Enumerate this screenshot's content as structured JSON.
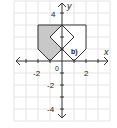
{
  "diagram": {
    "type": "coordinate-grid",
    "axes": {
      "x_label": "x",
      "y_label": "y",
      "origin_label": "0",
      "x_ticks": [
        {
          "value": -2,
          "label": "-2"
        },
        {
          "value": 2,
          "label": "2"
        }
      ],
      "y_ticks": [
        {
          "value": 4,
          "label": "4"
        },
        {
          "value": -2,
          "label": "-2"
        },
        {
          "value": -4,
          "label": "-4"
        }
      ],
      "x_range": [
        -4,
        4
      ],
      "y_range": [
        -5,
        5
      ]
    },
    "shapes": [
      {
        "name": "shaded-pentagon",
        "points": [
          [
            -2,
            3
          ],
          [
            0,
            3
          ],
          [
            0,
            1
          ],
          [
            -1,
            0
          ],
          [
            -2,
            1
          ]
        ],
        "fill": "#c8c8c8"
      },
      {
        "name": "reflected-pentagon",
        "points": [
          [
            0,
            3
          ],
          [
            2,
            3
          ],
          [
            2,
            1
          ],
          [
            1,
            0
          ],
          [
            0,
            1
          ]
        ],
        "fill": "#ffffff"
      },
      {
        "name": "diamond",
        "points": [
          [
            0,
            3
          ],
          [
            1,
            2
          ],
          [
            0,
            1
          ],
          [
            -1,
            2
          ]
        ],
        "fill": "#ffffff"
      }
    ],
    "point_marker": [
      0,
      1
    ],
    "part_label": "b)",
    "colors": {
      "grid": "#e2e2e2",
      "axis": "#333333",
      "shade": "#c8c8c8",
      "outline": "#333333"
    }
  }
}
